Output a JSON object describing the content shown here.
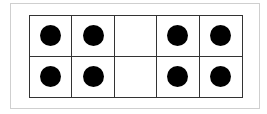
{
  "ten_frame": {
    "rows": 2,
    "columns": 5,
    "cells": [
      [
        true,
        true,
        false,
        true,
        true
      ],
      [
        true,
        true,
        false,
        true,
        true
      ]
    ],
    "dot_count": 8,
    "dot_color": "#000000",
    "border_color": "#333333"
  }
}
